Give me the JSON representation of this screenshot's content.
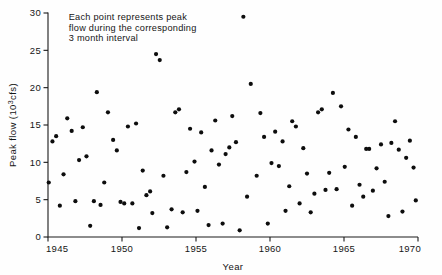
{
  "chart_data": {
    "type": "scatter",
    "title": "",
    "xlabel": "Year",
    "ylabel": "Peak flow (10³cfs)",
    "ylabel_parts": {
      "pre": "Peak flow (10",
      "sup": "3",
      "post": "cfs)"
    },
    "xlim": [
      1945,
      1970
    ],
    "ylim": [
      0,
      30
    ],
    "xticks": [
      1945,
      1950,
      1955,
      1960,
      1965,
      1970
    ],
    "yticks": [
      0,
      5,
      10,
      15,
      20,
      25,
      30
    ],
    "grid": false,
    "legend": null,
    "annotations": [
      {
        "name": "point-description",
        "lines": [
          "Each point represents peak",
          "flow during the corresponding",
          "3 month interval"
        ],
        "x": 1946.4,
        "y": 29.0
      }
    ],
    "marker": {
      "shape": "circle",
      "color": "#0d0d0d",
      "size": 2.1
    },
    "points": [
      {
        "x": 1945.05,
        "y": 7.3
      },
      {
        "x": 1945.3,
        "y": 12.8
      },
      {
        "x": 1945.55,
        "y": 13.5
      },
      {
        "x": 1945.8,
        "y": 4.2
      },
      {
        "x": 1946.05,
        "y": 8.4
      },
      {
        "x": 1946.3,
        "y": 15.9
      },
      {
        "x": 1946.6,
        "y": 14.2
      },
      {
        "x": 1946.85,
        "y": 4.8
      },
      {
        "x": 1947.1,
        "y": 10.3
      },
      {
        "x": 1947.35,
        "y": 14.7
      },
      {
        "x": 1947.6,
        "y": 10.8
      },
      {
        "x": 1947.85,
        "y": 1.5
      },
      {
        "x": 1948.1,
        "y": 4.8
      },
      {
        "x": 1948.3,
        "y": 19.4
      },
      {
        "x": 1948.55,
        "y": 4.3
      },
      {
        "x": 1948.8,
        "y": 7.3
      },
      {
        "x": 1949.05,
        "y": 16.7
      },
      {
        "x": 1949.4,
        "y": 13.0
      },
      {
        "x": 1949.65,
        "y": 11.6
      },
      {
        "x": 1949.9,
        "y": 4.7
      },
      {
        "x": 1950.15,
        "y": 4.5
      },
      {
        "x": 1950.4,
        "y": 14.8
      },
      {
        "x": 1950.7,
        "y": 4.5
      },
      {
        "x": 1950.95,
        "y": 15.2
      },
      {
        "x": 1951.15,
        "y": 1.2
      },
      {
        "x": 1951.4,
        "y": 8.9
      },
      {
        "x": 1951.65,
        "y": 5.6
      },
      {
        "x": 1951.9,
        "y": 6.1
      },
      {
        "x": 1952.05,
        "y": 3.2
      },
      {
        "x": 1952.3,
        "y": 24.5
      },
      {
        "x": 1952.55,
        "y": 23.7
      },
      {
        "x": 1952.8,
        "y": 8.2
      },
      {
        "x": 1953.05,
        "y": 1.3
      },
      {
        "x": 1953.35,
        "y": 3.7
      },
      {
        "x": 1953.6,
        "y": 16.7
      },
      {
        "x": 1953.85,
        "y": 17.1
      },
      {
        "x": 1954.1,
        "y": 3.3
      },
      {
        "x": 1954.35,
        "y": 8.7
      },
      {
        "x": 1954.6,
        "y": 14.5
      },
      {
        "x": 1954.9,
        "y": 10.1
      },
      {
        "x": 1955.1,
        "y": 3.5
      },
      {
        "x": 1955.35,
        "y": 14.0
      },
      {
        "x": 1955.6,
        "y": 6.7
      },
      {
        "x": 1955.85,
        "y": 1.6
      },
      {
        "x": 1956.05,
        "y": 11.6
      },
      {
        "x": 1956.3,
        "y": 15.6
      },
      {
        "x": 1956.55,
        "y": 9.7
      },
      {
        "x": 1956.8,
        "y": 1.8
      },
      {
        "x": 1957.0,
        "y": 11.1
      },
      {
        "x": 1957.25,
        "y": 12.0
      },
      {
        "x": 1957.45,
        "y": 16.2
      },
      {
        "x": 1957.7,
        "y": 12.7
      },
      {
        "x": 1957.95,
        "y": 0.9
      },
      {
        "x": 1958.2,
        "y": 29.5
      },
      {
        "x": 1958.45,
        "y": 5.4
      },
      {
        "x": 1958.7,
        "y": 20.5
      },
      {
        "x": 1959.1,
        "y": 8.2
      },
      {
        "x": 1959.35,
        "y": 16.6
      },
      {
        "x": 1959.6,
        "y": 13.4
      },
      {
        "x": 1959.85,
        "y": 1.8
      },
      {
        "x": 1960.1,
        "y": 9.9
      },
      {
        "x": 1960.35,
        "y": 14.1
      },
      {
        "x": 1960.6,
        "y": 9.5
      },
      {
        "x": 1960.85,
        "y": 12.8
      },
      {
        "x": 1961.05,
        "y": 3.5
      },
      {
        "x": 1961.3,
        "y": 6.8
      },
      {
        "x": 1961.5,
        "y": 15.5
      },
      {
        "x": 1961.75,
        "y": 14.8
      },
      {
        "x": 1962.0,
        "y": 4.5
      },
      {
        "x": 1962.25,
        "y": 11.9
      },
      {
        "x": 1962.5,
        "y": 8.5
      },
      {
        "x": 1962.75,
        "y": 3.3
      },
      {
        "x": 1963.0,
        "y": 5.8
      },
      {
        "x": 1963.25,
        "y": 16.7
      },
      {
        "x": 1963.5,
        "y": 17.1
      },
      {
        "x": 1963.75,
        "y": 6.3
      },
      {
        "x": 1964.0,
        "y": 8.6
      },
      {
        "x": 1964.25,
        "y": 19.3
      },
      {
        "x": 1964.5,
        "y": 6.4
      },
      {
        "x": 1964.8,
        "y": 17.5
      },
      {
        "x": 1965.05,
        "y": 9.4
      },
      {
        "x": 1965.3,
        "y": 14.4
      },
      {
        "x": 1965.55,
        "y": 4.2
      },
      {
        "x": 1965.8,
        "y": 13.4
      },
      {
        "x": 1966.05,
        "y": 7.0
      },
      {
        "x": 1966.3,
        "y": 5.4
      },
      {
        "x": 1966.5,
        "y": 11.8
      },
      {
        "x": 1966.7,
        "y": 11.8
      },
      {
        "x": 1966.95,
        "y": 6.2
      },
      {
        "x": 1967.2,
        "y": 9.2
      },
      {
        "x": 1967.5,
        "y": 12.4
      },
      {
        "x": 1967.75,
        "y": 7.4
      },
      {
        "x": 1968.0,
        "y": 2.8
      },
      {
        "x": 1968.2,
        "y": 12.6
      },
      {
        "x": 1968.45,
        "y": 15.5
      },
      {
        "x": 1968.7,
        "y": 11.7
      },
      {
        "x": 1968.95,
        "y": 3.4
      },
      {
        "x": 1969.2,
        "y": 10.6
      },
      {
        "x": 1969.45,
        "y": 12.9
      },
      {
        "x": 1969.7,
        "y": 9.3
      },
      {
        "x": 1969.85,
        "y": 4.9
      }
    ]
  }
}
